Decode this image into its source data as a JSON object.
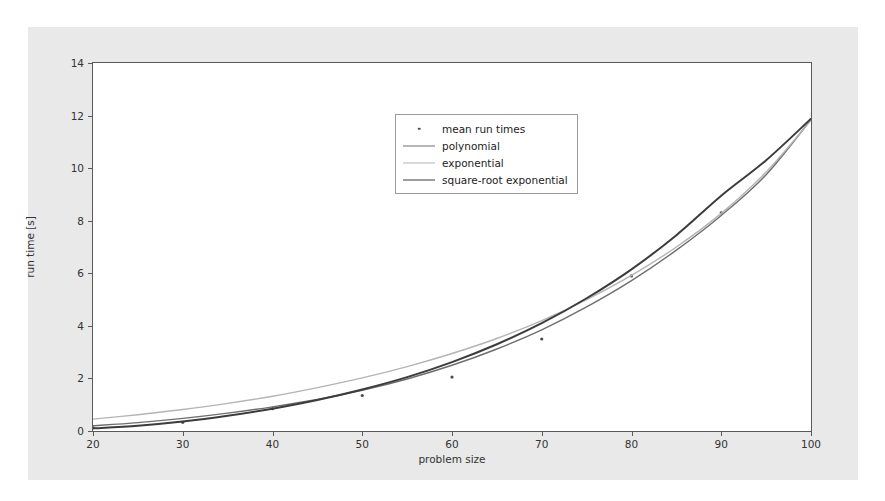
{
  "chart_data": {
    "type": "line",
    "title": "",
    "xlabel": "problem size",
    "ylabel": "run time [s]",
    "xlim": [
      20,
      100
    ],
    "ylim": [
      0,
      14
    ],
    "xticks": [
      20,
      30,
      40,
      50,
      60,
      70,
      80,
      90,
      100
    ],
    "yticks": [
      0,
      2,
      4,
      6,
      8,
      10,
      12,
      14
    ],
    "grid": false,
    "legend_position": "upper center",
    "legend_entries": [
      "mean run times",
      "polynomial",
      "exponential",
      "square-root exponential"
    ],
    "colors": {
      "marker": "#4c4c4c",
      "polynomial": "#6e6e6e",
      "exponential": "#b4b4b4",
      "square_root_exponential": "#3c3c3c",
      "figure_background": "#e9e9e9",
      "axes_background": "#ffffff",
      "axis_line": "#5a5a5a"
    },
    "series": [
      {
        "name": "mean run times",
        "type": "scatter",
        "x": [
          20,
          30,
          40,
          50,
          60,
          70,
          80,
          90,
          100
        ],
        "y": [
          0.12,
          0.33,
          0.85,
          1.35,
          2.05,
          3.5,
          5.9,
          8.3,
          11.85
        ]
      },
      {
        "name": "polynomial",
        "type": "line",
        "x": [
          20,
          25,
          30,
          35,
          40,
          45,
          50,
          55,
          60,
          65,
          70,
          75,
          80,
          85,
          90,
          95,
          100
        ],
        "y": [
          0.2,
          0.32,
          0.48,
          0.68,
          0.92,
          1.2,
          1.55,
          1.98,
          2.5,
          3.12,
          3.85,
          4.72,
          5.72,
          6.88,
          8.2,
          9.75,
          11.85
        ]
      },
      {
        "name": "exponential",
        "type": "line",
        "x": [
          20,
          25,
          30,
          35,
          40,
          45,
          50,
          55,
          60,
          65,
          70,
          75,
          80,
          85,
          90,
          95,
          100
        ],
        "y": [
          0.45,
          0.62,
          0.82,
          1.05,
          1.32,
          1.65,
          2.02,
          2.45,
          2.95,
          3.52,
          4.2,
          5.0,
          5.92,
          7.0,
          8.28,
          9.85,
          11.82
        ]
      },
      {
        "name": "square-root exponential",
        "type": "line",
        "x": [
          20,
          25,
          30,
          35,
          40,
          45,
          50,
          55,
          60,
          65,
          70,
          75,
          80,
          85,
          90,
          95,
          100
        ],
        "y": [
          0.1,
          0.2,
          0.36,
          0.58,
          0.85,
          1.18,
          1.58,
          2.05,
          2.62,
          3.3,
          4.1,
          5.05,
          6.15,
          7.45,
          8.95,
          10.3,
          11.88
        ]
      }
    ]
  },
  "axes": {
    "xtick_labels": [
      "20",
      "30",
      "40",
      "50",
      "60",
      "70",
      "80",
      "90",
      "100"
    ],
    "ytick_labels": [
      "0",
      "2",
      "4",
      "6",
      "8",
      "10",
      "12",
      "14"
    ],
    "xlabel": "problem size",
    "ylabel": "run time [s]"
  },
  "legend": {
    "items": [
      {
        "label": "mean run times",
        "key": "marker-dot"
      },
      {
        "label": "polynomial",
        "key": "line-medium-gray"
      },
      {
        "label": "exponential",
        "key": "line-light-gray"
      },
      {
        "label": "square-root exponential",
        "key": "line-dark-gray"
      }
    ]
  }
}
